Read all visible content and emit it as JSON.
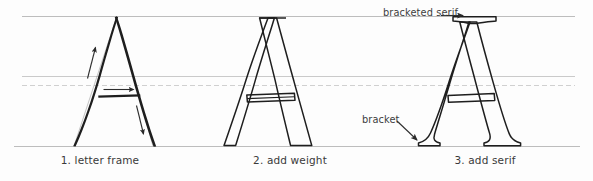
{
  "figure": {
    "background_color": "#fdfdfd",
    "ink_color": "#1b1b1b",
    "guide_color": "#b9b9b9",
    "guide_color_faint": "#cfcfcf",
    "text_color": "#3a3a3a",
    "width": 593,
    "height": 181
  },
  "guides": [
    {
      "name": "cap-height-line",
      "y": 16,
      "style": "solid",
      "color": "#b5b5b5"
    },
    {
      "name": "upper-crossbar-guide",
      "y": 76,
      "style": "solid",
      "color": "#c4c4c4"
    },
    {
      "name": "lower-crossbar-guide",
      "y": 85,
      "style": "dashed",
      "color": "#c9c9c9"
    },
    {
      "name": "baseline",
      "y": 146,
      "style": "solid",
      "color": "#b5b5b5"
    }
  ],
  "panels": [
    {
      "id": "panel-1",
      "caption": "1. letter frame",
      "description": "Skeleton outline of the letter A drawn with single strokes",
      "strokes": [
        "left-diagonal",
        "right-diagonal",
        "crossbar"
      ],
      "arrows": [
        {
          "name": "stroke-direction-arrow-up",
          "direction": "up",
          "along": "left-diagonal"
        },
        {
          "name": "stroke-direction-arrow-right",
          "direction": "right",
          "along": "crossbar"
        },
        {
          "name": "stroke-direction-arrow-down",
          "direction": "down",
          "along": "right-diagonal"
        }
      ]
    },
    {
      "id": "panel-2",
      "caption": "2. add weight",
      "description": "Outlines thickened to give the strokes weight; thin left stem, thick right stem",
      "strokes": [
        "left-diagonal-weighted",
        "right-diagonal-weighted",
        "crossbar-band"
      ]
    },
    {
      "id": "panel-3",
      "caption": "3. add serif",
      "description": "Serifs added at apex and both feet, joined to the stems by brackets",
      "strokes": [
        "left-diagonal-serifed",
        "right-diagonal-serifed",
        "crossbar",
        "apex-serif",
        "left-foot-serif",
        "right-foot-serif"
      ]
    }
  ],
  "annotations": [
    {
      "name": "bracketed-serif-label",
      "text": "bracketed serif",
      "arrow": "straight-right-arrow",
      "points_to": "apex serif of panel 3"
    },
    {
      "name": "bracket-label",
      "text": "bracket",
      "arrow": "diagonal-down-right-arrow",
      "points_to": "left foot bracket of panel 3"
    }
  ]
}
